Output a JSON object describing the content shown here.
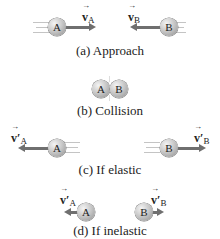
{
  "panels": [
    {
      "id": "a",
      "caption": "(a) Approach",
      "ball_a": {
        "label": "A"
      },
      "ball_b": {
        "label": "B"
      },
      "velocity_a": {
        "symbol": "v",
        "prime": "",
        "subscript": "A",
        "direction": "right"
      },
      "velocity_b": {
        "symbol": "v",
        "prime": "",
        "subscript": "B",
        "direction": "left"
      }
    },
    {
      "id": "b",
      "caption": "(b) Collision",
      "ball_a": {
        "label": "A"
      },
      "ball_b": {
        "label": "B"
      }
    },
    {
      "id": "c",
      "caption": "(c) If elastic",
      "ball_a": {
        "label": "A"
      },
      "ball_b": {
        "label": "B"
      },
      "velocity_a": {
        "symbol": "v",
        "prime": "′",
        "subscript": "A",
        "direction": "left"
      },
      "velocity_b": {
        "symbol": "v",
        "prime": "′",
        "subscript": "B",
        "direction": "right"
      }
    },
    {
      "id": "d",
      "caption": "(d) If inelastic",
      "ball_a": {
        "label": "A"
      },
      "ball_b": {
        "label": "B"
      },
      "velocity_a": {
        "symbol": "v",
        "prime": "′",
        "subscript": "A",
        "direction": "left"
      },
      "velocity_b": {
        "symbol": "v",
        "prime": "′",
        "subscript": "B",
        "direction": "right"
      }
    }
  ],
  "colors": {
    "arrow": "#6f6f6f",
    "ball": "#b0b0b0",
    "trail": "#c4c4c4"
  }
}
